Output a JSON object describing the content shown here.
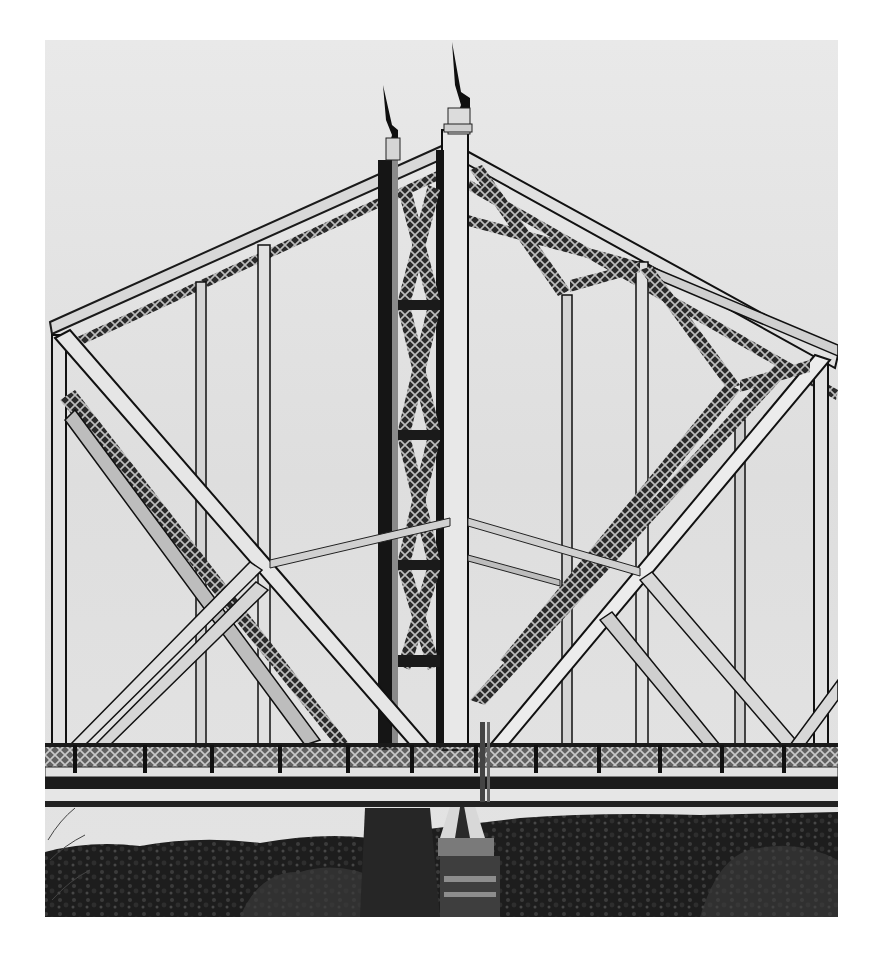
{
  "image": {
    "subject": "Steel truss bridge tower",
    "style": "black-and-white photograph",
    "description": "Close view of a steel truss bridge with a central lattice tower topped by two spires, diagonal truss members, a railing along the deck, and a stone pier above dense trees"
  }
}
